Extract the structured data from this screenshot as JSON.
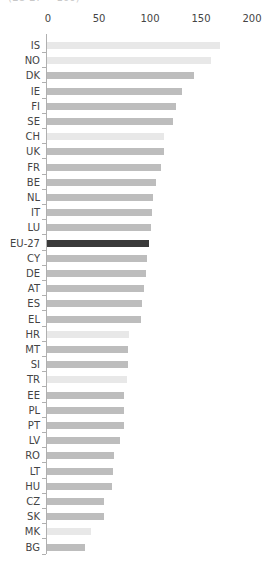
{
  "chart_data": {
    "type": "bar",
    "orientation": "horizontal",
    "title": "",
    "subtitle": "(EU-27 = 100)",
    "xlabel": "",
    "ylabel": "",
    "xlim": [
      0,
      200
    ],
    "xticks": [
      "0",
      "50",
      "100",
      "150",
      "200"
    ],
    "grid": false,
    "legend": null,
    "categories": [
      "IS",
      "NO",
      "DK",
      "IE",
      "FI",
      "SE",
      "CH",
      "UK",
      "FR",
      "BE",
      "NL",
      "IT",
      "LU",
      "EU-27",
      "CY",
      "DE",
      "AT",
      "ES",
      "EL",
      "HR",
      "MT",
      "SI",
      "TR",
      "EE",
      "PL",
      "PT",
      "LV",
      "RO",
      "LT",
      "HU",
      "CZ",
      "SK",
      "MK",
      "BG"
    ],
    "values": [
      170,
      161,
      144,
      132,
      126,
      124,
      115,
      115,
      112,
      107,
      104,
      103,
      102,
      100,
      98,
      97,
      95,
      93,
      92,
      80,
      79,
      79,
      78,
      75,
      75,
      75,
      72,
      66,
      65,
      64,
      56,
      56,
      43,
      37
    ],
    "bar_kind": [
      "light",
      "light",
      "normal",
      "normal",
      "normal",
      "normal",
      "light",
      "normal",
      "normal",
      "normal",
      "normal",
      "normal",
      "normal",
      "highlight",
      "normal",
      "normal",
      "normal",
      "normal",
      "normal",
      "light",
      "normal",
      "normal",
      "light",
      "normal",
      "normal",
      "normal",
      "normal",
      "normal",
      "normal",
      "normal",
      "normal",
      "normal",
      "light",
      "normal"
    ]
  },
  "colors": {
    "normal": "#bdbdbd",
    "light": "#e8e8e8",
    "highlight": "#3a3a3a"
  }
}
